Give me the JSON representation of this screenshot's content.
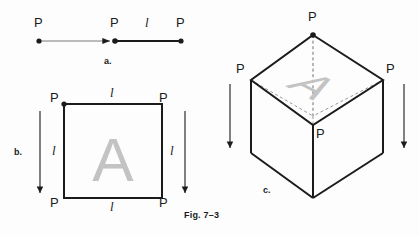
{
  "figure": {
    "caption": "Fig. 7–3",
    "background_color": "#fdfdfd",
    "line_color": "#1b1b1b",
    "ghost_letter_color": "#c3c3c3",
    "parts": {
      "a": "a.",
      "b": "b.",
      "c": "c."
    },
    "labels": {
      "point": "P",
      "length": "l"
    }
  },
  "part_a": {
    "part_label": "a.",
    "points": [
      {
        "name": "P",
        "label": "P"
      },
      {
        "name": "P",
        "label": "P"
      },
      {
        "name": "P",
        "label": "P"
      }
    ],
    "segment_length_label": "l"
  },
  "part_b": {
    "part_label": "b.",
    "face_letter": "A",
    "corner_labels": [
      "P",
      "P",
      "P",
      "P"
    ],
    "edge_length_labels": [
      "l",
      "l",
      "l",
      "l"
    ]
  },
  "part_c": {
    "part_label": "c.",
    "face_letter": "A",
    "vertex_labels": [
      "P",
      "P",
      "P",
      "P"
    ]
  }
}
